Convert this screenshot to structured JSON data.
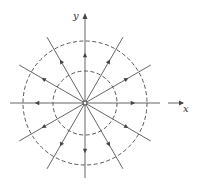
{
  "diagram": {
    "type": "radial vector field (source at origin)",
    "axes": {
      "x_label": "x",
      "y_label": "y"
    },
    "origin": {
      "x": 85,
      "y": 103
    },
    "circles": [
      {
        "name": "inner",
        "radius": 32,
        "style": "dashed"
      },
      {
        "name": "outer",
        "radius": 62,
        "style": "dashed"
      }
    ],
    "field_lines": {
      "count": 12,
      "angle_step_deg": 30,
      "direction": "outward",
      "length": 76
    },
    "colors": {
      "line": "#555555",
      "dashed": "#444444"
    }
  }
}
